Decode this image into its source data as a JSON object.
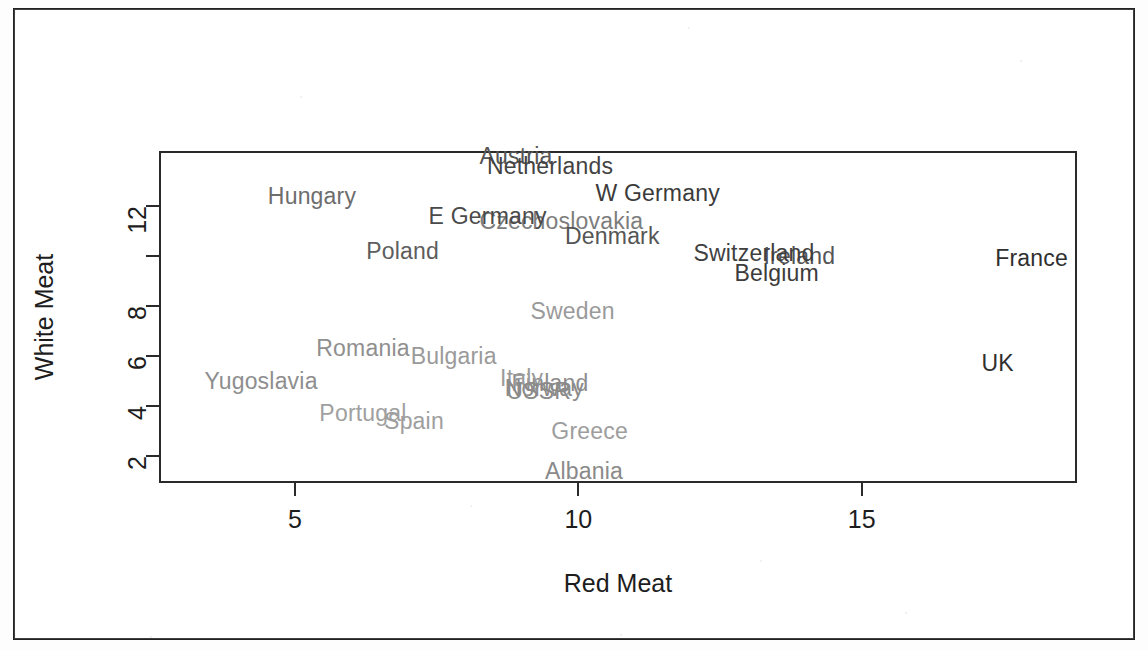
{
  "chart_data": {
    "type": "scatter",
    "title": "",
    "subtitle": "",
    "xlabel": "Red Meat",
    "ylabel": "White Meat",
    "xlim": [
      2.6,
      18.8
    ],
    "ylim": [
      0.9,
      14.2
    ],
    "xticks": [
      5,
      10,
      15
    ],
    "xtick_labels": [
      "5",
      "10",
      "15"
    ],
    "yticks": [
      2,
      4,
      6,
      8,
      10,
      12
    ],
    "ytick_labels": [
      "2",
      "4",
      "6",
      "8",
      "",
      "12"
    ],
    "grid": false,
    "legend": "none",
    "marker": "text-label",
    "label_color": "#6f6f6f",
    "axis_color": "#2a2a2a",
    "points": [
      {
        "label": "Albania",
        "x": 10.1,
        "y": 1.4,
        "color": "#8a8a8a"
      },
      {
        "label": "Austria",
        "x": 8.9,
        "y": 14.0,
        "color": "#565656"
      },
      {
        "label": "Belgium",
        "x": 13.5,
        "y": 9.3,
        "color": "#3c3c3c"
      },
      {
        "label": "Bulgaria",
        "x": 7.8,
        "y": 6.0,
        "color": "#9a9a9a"
      },
      {
        "label": "Czechoslovakia",
        "x": 9.7,
        "y": 11.4,
        "color": "#7d7d7d"
      },
      {
        "label": "Denmark",
        "x": 10.6,
        "y": 10.8,
        "color": "#555555"
      },
      {
        "label": "E Germany",
        "x": 8.4,
        "y": 11.6,
        "color": "#4a4a4a"
      },
      {
        "label": "Finland",
        "x": 9.5,
        "y": 4.9,
        "color": "#8d8d8d"
      },
      {
        "label": "France",
        "x": 18.0,
        "y": 9.9,
        "color": "#2f2f2f"
      },
      {
        "label": "Greece",
        "x": 10.2,
        "y": 3.0,
        "color": "#9d9d9d"
      },
      {
        "label": "Hungary",
        "x": 5.3,
        "y": 12.4,
        "color": "#6d6d6d"
      },
      {
        "label": "Ireland",
        "x": 13.9,
        "y": 10.0,
        "color": "#555555"
      },
      {
        "label": "Italy",
        "x": 9.0,
        "y": 5.1,
        "color": "#9b9b9b"
      },
      {
        "label": "Netherlands",
        "x": 9.5,
        "y": 13.6,
        "color": "#434343"
      },
      {
        "label": "Norway",
        "x": 9.4,
        "y": 4.7,
        "color": "#8b8b8b"
      },
      {
        "label": "Poland",
        "x": 6.9,
        "y": 10.2,
        "color": "#5d5d5d"
      },
      {
        "label": "Portugal",
        "x": 6.2,
        "y": 3.7,
        "color": "#a0a0a0"
      },
      {
        "label": "Romania",
        "x": 6.2,
        "y": 6.3,
        "color": "#8f8f8f"
      },
      {
        "label": "Spain",
        "x": 7.1,
        "y": 3.4,
        "color": "#9e9e9e"
      },
      {
        "label": "Sweden",
        "x": 9.9,
        "y": 7.8,
        "color": "#9a9a9a"
      },
      {
        "label": "Switzerland",
        "x": 13.1,
        "y": 10.1,
        "color": "#3f3f3f"
      },
      {
        "label": "UK",
        "x": 17.4,
        "y": 5.7,
        "color": "#2f2f2f"
      },
      {
        "label": "USSR",
        "x": 9.3,
        "y": 4.6,
        "color": "#8a8a8a"
      },
      {
        "label": "W Germany",
        "x": 11.4,
        "y": 12.5,
        "color": "#3b3b3b"
      },
      {
        "label": "Yugoslavia",
        "x": 4.4,
        "y": 5.0,
        "color": "#8e8e8e"
      }
    ]
  },
  "axes": {
    "x_label": "Red Meat",
    "y_label": "White Meat",
    "x_tick_labels": [
      "5",
      "10",
      "15"
    ],
    "y_tick_labels": [
      "2",
      "4",
      "6",
      "8",
      "",
      "12"
    ]
  }
}
